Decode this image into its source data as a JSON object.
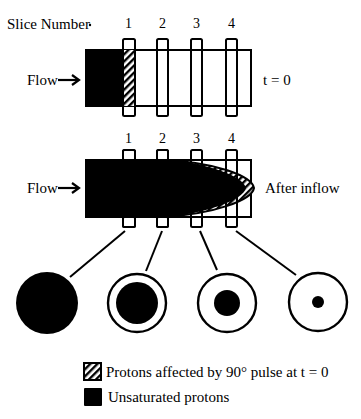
{
  "header": {
    "slice_label": "Slice Number"
  },
  "slices": [
    "1",
    "2",
    "3",
    "4"
  ],
  "top_panel": {
    "flow_label": "Flow",
    "time_label": "t = 0"
  },
  "bottom_panel": {
    "flow_label": "Flow",
    "state_label": "After inflow"
  },
  "cross_sections": [
    {
      "slice": "1",
      "inner_fill": "full"
    },
    {
      "slice": "2",
      "inner_fill": "large"
    },
    {
      "slice": "3",
      "inner_fill": "medium"
    },
    {
      "slice": "4",
      "inner_fill": "small"
    }
  ],
  "legend": {
    "items": [
      {
        "icon": "hatched-square-icon",
        "label": "Protons affected by 90° pulse at t = 0"
      },
      {
        "icon": "solid-square-icon",
        "label": "Unsaturated protons"
      }
    ]
  },
  "colors": {
    "ink": "#000000",
    "background": "#ffffff"
  }
}
